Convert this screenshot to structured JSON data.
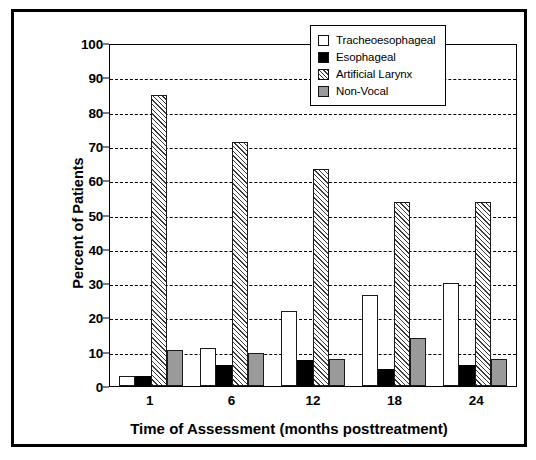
{
  "chart_data": {
    "type": "bar",
    "title": "",
    "xlabel": "Time of Assessment (months posttreatment)",
    "ylabel": "Percent of Patients",
    "ylim": [
      0,
      100
    ],
    "ytick_step": 10,
    "yticks": [
      0,
      10,
      20,
      30,
      40,
      50,
      60,
      70,
      80,
      90,
      100
    ],
    "categories": [
      "1",
      "6",
      "12",
      "18",
      "24"
    ],
    "grid": "horizontal-dashed",
    "legend_position": "top-right",
    "series": [
      {
        "name": "Tracheoesophageal",
        "fill": "white",
        "color": "#ffffff",
        "values": [
          3,
          11,
          22,
          26.5,
          30
        ]
      },
      {
        "name": "Esophageal",
        "fill": "black",
        "color": "#000000",
        "values": [
          3,
          6,
          7.5,
          5,
          6
        ]
      },
      {
        "name": "Artificial Larynx",
        "fill": "hatched",
        "color": "#3a3a3a",
        "values": [
          84.8,
          71.2,
          63.2,
          53.6,
          53.6
        ]
      },
      {
        "name": "Non-Vocal",
        "fill": "gray",
        "color": "#9a9a9a",
        "values": [
          10.6,
          9.5,
          7.8,
          14,
          7.8
        ]
      }
    ]
  },
  "axes": {
    "y_title": "Percent of Patients",
    "x_title": "Time of Assessment (months posttreatment)",
    "y_ticks": [
      "100",
      "90",
      "80",
      "70",
      "60",
      "50",
      "40",
      "30",
      "20",
      "10",
      "0"
    ],
    "x_ticks": [
      "1",
      "6",
      "12",
      "18",
      "24"
    ]
  },
  "legend": {
    "items": [
      {
        "label": "Tracheoesophageal"
      },
      {
        "label": "Esophageal"
      },
      {
        "label": "Artificial Larynx"
      },
      {
        "label": "Non-Vocal"
      }
    ]
  }
}
